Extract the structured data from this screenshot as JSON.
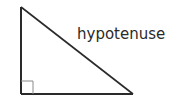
{
  "diagram": {
    "type": "right-triangle",
    "labels": {
      "hypotenuse": "hypotenuse"
    },
    "right_angle_marker": true,
    "colors": {
      "stroke": "#2a2a2a",
      "marker": "#8a8a8a",
      "background": "#ffffff"
    }
  }
}
